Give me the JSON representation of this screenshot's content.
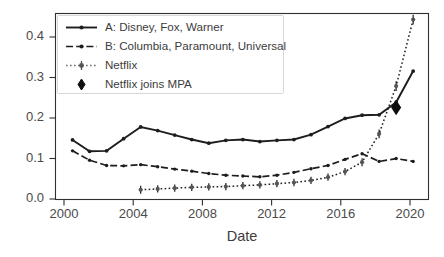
{
  "chart_data": {
    "type": "line",
    "title": "",
    "xlabel": "Date",
    "ylabel": "",
    "xlim": [
      1999.0,
      2020.9
    ],
    "ylim": [
      -0.012,
      0.447
    ],
    "xticks": [
      2000,
      2004,
      2008,
      2012,
      2016,
      2020
    ],
    "xtick_labels": [
      "2000",
      "2004",
      "2008",
      "2012",
      "2016",
      "2020"
    ],
    "yticks": [
      0.0,
      0.1,
      0.2,
      0.3,
      0.4
    ],
    "ytick_labels": [
      "0.0",
      "0.1",
      "0.2",
      "0.3",
      "0.4"
    ],
    "grid": false,
    "legend_position": "upper left",
    "series": [
      {
        "name": "A: Disney, Fox, Warner",
        "style": "solid",
        "marker": "dot",
        "x": [
          2000,
          2001,
          2002,
          2003,
          2004,
          2005,
          2006,
          2007,
          2008,
          2009,
          2010,
          2011,
          2012,
          2013,
          2014,
          2015,
          2016,
          2017,
          2018,
          2019,
          2020
        ],
        "values": [
          0.135,
          0.107,
          0.108,
          0.138,
          0.167,
          0.158,
          0.147,
          0.136,
          0.127,
          0.134,
          0.136,
          0.131,
          0.134,
          0.136,
          0.148,
          0.168,
          0.188,
          0.196,
          0.197,
          0.228,
          0.305
        ]
      },
      {
        "name": "B: Columbia, Paramount, Universal",
        "style": "dashed",
        "marker": "dot",
        "x": [
          2000,
          2001,
          2002,
          2003,
          2004,
          2005,
          2006,
          2007,
          2008,
          2009,
          2010,
          2011,
          2012,
          2013,
          2014,
          2015,
          2016,
          2017,
          2018,
          2019,
          2020
        ],
        "values": [
          0.108,
          0.085,
          0.072,
          0.071,
          0.074,
          0.069,
          0.063,
          0.058,
          0.052,
          0.048,
          0.046,
          0.044,
          0.048,
          0.055,
          0.064,
          0.072,
          0.087,
          0.101,
          0.082,
          0.089,
          0.082
        ]
      },
      {
        "name": "Netflix",
        "style": "dotted",
        "marker": "dot-errorbar",
        "x": [
          2004,
          2005,
          2006,
          2007,
          2008,
          2009,
          2010,
          2011,
          2012,
          2013,
          2014,
          2015,
          2016,
          2017,
          2018,
          2019,
          2020
        ],
        "values": [
          0.012,
          0.014,
          0.016,
          0.018,
          0.019,
          0.02,
          0.022,
          0.024,
          0.027,
          0.03,
          0.035,
          0.043,
          0.057,
          0.08,
          0.15,
          0.268,
          0.432
        ],
        "error": [
          0.01,
          0.009,
          0.009,
          0.009,
          0.009,
          0.009,
          0.009,
          0.009,
          0.009,
          0.009,
          0.009,
          0.009,
          0.009,
          0.01,
          0.011,
          0.012,
          0.012
        ]
      }
    ],
    "annotations": [
      {
        "name": "Netflix joins MPA",
        "marker": "diamond",
        "x": 2019.0,
        "y": 0.215
      }
    ]
  },
  "legend": {
    "entries": [
      {
        "label": "A: Disney, Fox, Warner"
      },
      {
        "label": "B: Columbia, Paramount, Universal"
      },
      {
        "label": "Netflix"
      },
      {
        "label": "Netflix joins MPA"
      }
    ]
  },
  "caption": {
    "text": ""
  }
}
